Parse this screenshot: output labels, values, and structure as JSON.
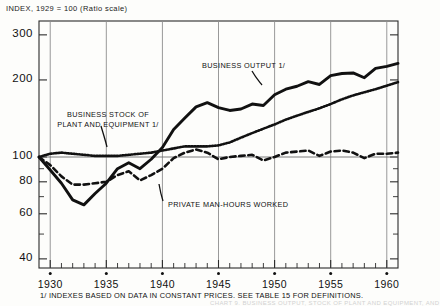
{
  "title": "INDEX, 1929 = 100 (Ratio scale)",
  "footnote": "1/ INDEXES BASED ON DATA IN CONSTANT PRICES.  SEE TABLE 15 FOR DEFINITIONS.",
  "ghost_text": "CHART 9.  BUSINESS OUTPUT, STOCK OF PLANT AND EQUIPMENT, AND",
  "annotations": {
    "business_output": "BUSINESS OUTPUT 1/",
    "plant_equipment_line1": "BUSINESS STOCK OF",
    "plant_equipment_line2": "PLANT AND EQUIPMENT 1/",
    "man_hours": "PRIVATE MAN-HOURS WORKED"
  },
  "colors": {
    "ink": "#111111",
    "grid": "#8d8d8d",
    "paper": "#fdfdfb"
  },
  "chart_data": {
    "type": "line",
    "title": "INDEX, 1929 = 100 (Ratio scale)",
    "xlabel": "",
    "ylabel": "INDEX, 1929 = 100",
    "scale": "log",
    "grid": true,
    "legend_position": "inline-annotations",
    "xlim": [
      1929,
      1961
    ],
    "ylim": [
      40,
      330
    ],
    "ytick_labels": [
      "300",
      "200",
      "100",
      "80",
      "60",
      "40"
    ],
    "yticks": [
      300,
      200,
      100,
      80,
      60,
      40
    ],
    "yminor": [
      40,
      50,
      60,
      70,
      80,
      90,
      100,
      200,
      300
    ],
    "xtick_labels": [
      "1930",
      "1935",
      "1940",
      "1945",
      "1950",
      "1955",
      "1960"
    ],
    "xticks": [
      1930,
      1935,
      1940,
      1945,
      1950,
      1955,
      1960
    ],
    "xminor_step": 1,
    "gridline_years": [
      1930,
      1935,
      1940,
      1945,
      1950,
      1955,
      1960
    ],
    "x": [
      1929,
      1930,
      1931,
      1932,
      1933,
      1934,
      1935,
      1936,
      1937,
      1938,
      1939,
      1940,
      1941,
      1942,
      1943,
      1944,
      1945,
      1946,
      1947,
      1948,
      1949,
      1950,
      1951,
      1952,
      1953,
      1954,
      1955,
      1956,
      1957,
      1958,
      1959,
      1960,
      1961
    ],
    "series": [
      {
        "name": "BUSINESS OUTPUT 1/",
        "style": "solid-thick",
        "values": [
          100,
          89,
          79,
          68,
          65,
          72,
          79,
          90,
          95,
          90,
          98,
          109,
          128,
          142,
          157,
          163,
          156,
          152,
          154,
          161,
          159,
          175,
          184,
          189,
          197,
          192,
          208,
          212,
          213,
          204,
          222,
          226,
          232
        ]
      },
      {
        "name": "BUSINESS STOCK OF PLANT AND EQUIPMENT 1/",
        "style": "dotted",
        "values": [
          100,
          103,
          104,
          103,
          102,
          101,
          101,
          101,
          102,
          103,
          104,
          106,
          108,
          110,
          110,
          110,
          111,
          114,
          119,
          124,
          129,
          134,
          140,
          145,
          150,
          155,
          161,
          168,
          174,
          179,
          184,
          190,
          196
        ]
      },
      {
        "name": "PRIVATE MAN-HOURS WORKED",
        "style": "dashed",
        "values": [
          100,
          93,
          84,
          78,
          78,
          79,
          80,
          85,
          88,
          81,
          85,
          90,
          99,
          104,
          107,
          104,
          98,
          100,
          101,
          102,
          97,
          100,
          104,
          105,
          106,
          101,
          105,
          106,
          104,
          99,
          103,
          103,
          104
        ]
      }
    ]
  }
}
